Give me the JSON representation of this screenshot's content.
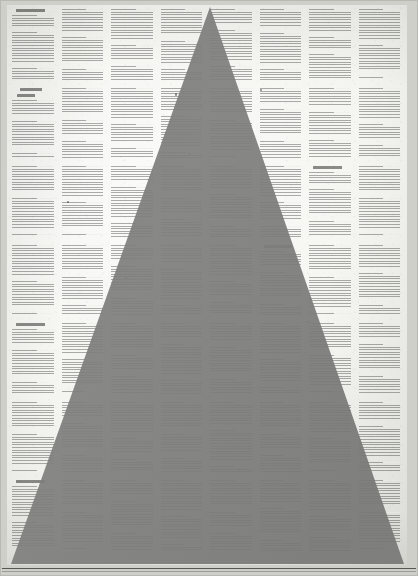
{
  "artwork": {
    "title": "Printed text page with large grey triangle overlay",
    "medium": "photograph of a printed sheet",
    "background_color": "#f4f4f1",
    "paper_color": "#f4f4f1",
    "triangle_color": "#7d7d7b",
    "text_color": "#5c5c5a",
    "rule_color": "#2d2d2b"
  },
  "page": {
    "width": 418,
    "height": 576,
    "sheet_margin_left": 7,
    "sheet_margin_top": 5
  },
  "triangle": {
    "shape": "isosceles-triangle",
    "apex_x": 210,
    "apex_y": 7,
    "base_left_x": 11,
    "base_right_x": 404,
    "base_y": 564,
    "fill": "#7d7d7b",
    "opacity": 0.93
  },
  "text_grid": {
    "columns": 8,
    "rows": 7,
    "column_gap": 6,
    "row_gap": 7,
    "description": "dense grid of justified body-text blocks, illegible at reproduction size"
  },
  "headings": [
    {
      "id": "heading-1",
      "column": 1,
      "row": 1,
      "align": "left",
      "style": "caps"
    },
    {
      "id": "heading-2",
      "column": 1,
      "row": 2,
      "align": "center",
      "style": "caps"
    },
    {
      "id": "heading-3",
      "column": 1,
      "row": 5,
      "align": "left",
      "style": "caps"
    },
    {
      "id": "heading-4",
      "column": 1,
      "row": 7,
      "align": "left",
      "style": "caps"
    },
    {
      "id": "heading-5",
      "column": 7,
      "row": 3,
      "align": "left",
      "style": "caps"
    },
    {
      "id": "heading-6",
      "column": 6,
      "row": 4,
      "align": "left",
      "style": "caps"
    }
  ],
  "rules": {
    "bottom_rule_y": 568,
    "bottom_rule_secondary_y": 571
  }
}
